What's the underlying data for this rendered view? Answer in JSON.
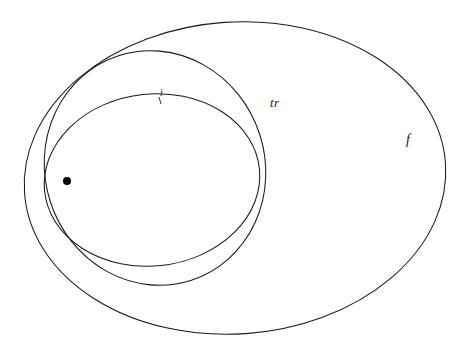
{
  "figure": {
    "background_color": "#ffffff",
    "stroke_color": "#1a1a1a",
    "width": 464,
    "height": 355
  },
  "labels": {
    "outer": "f",
    "middle": "tr",
    "inner": "i"
  },
  "regions": [
    {
      "name": "outer-ellipse",
      "label": "f",
      "center_x": 235,
      "center_y": 178,
      "radius_x": 211,
      "radius_y": 156,
      "rotation_deg": -4
    },
    {
      "name": "middle-ellipse",
      "label": "tr",
      "center_x": 155,
      "center_y": 168,
      "radius_x": 110,
      "radius_y": 118,
      "rotation_deg": -18
    },
    {
      "name": "inner-ellipse",
      "label": "i",
      "center_x": 152,
      "center_y": 180,
      "radius_x": 108,
      "radius_y": 86,
      "rotation_deg": -6
    }
  ],
  "point": {
    "name": "marked-point",
    "x": 67,
    "y": 181,
    "radius": 4,
    "color": "#000000"
  },
  "label_positions": {
    "f": {
      "x": 406,
      "y": 133
    },
    "tr": {
      "x": 270,
      "y": 96
    },
    "i": {
      "x": 160,
      "y": 88
    }
  },
  "tick": {
    "name": "inner-label-tick",
    "x1": 159,
    "y1": 97,
    "x2": 161,
    "y2": 104
  }
}
